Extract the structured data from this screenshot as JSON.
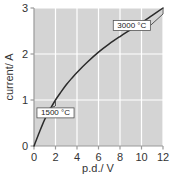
{
  "chart_data": {
    "type": "line",
    "title": "",
    "xlabel": "p.d./ V",
    "ylabel": "current/ A",
    "xlim": [
      0,
      12
    ],
    "ylim": [
      0,
      3
    ],
    "grid": true,
    "legend": "none",
    "xticks": [
      "0",
      "2",
      "4",
      "6",
      "8",
      "10",
      "12"
    ],
    "xtick_values": [
      0,
      2,
      4,
      6,
      8,
      10,
      12
    ],
    "yticks": [
      "0",
      "1",
      "2",
      "3"
    ],
    "ytick_values": [
      0,
      1,
      2,
      3
    ],
    "series": [
      {
        "name": "filament lamp I-V characteristic",
        "color": "#2b2b2b",
        "x": [
          0,
          0.5,
          1,
          1.5,
          2,
          2.5,
          3,
          3.5,
          4,
          5,
          6,
          7,
          8,
          9,
          10,
          11,
          12
        ],
        "values": [
          0,
          0.3,
          0.58,
          0.8,
          1.0,
          1.17,
          1.33,
          1.47,
          1.6,
          1.83,
          2.04,
          2.22,
          2.38,
          2.53,
          2.68,
          2.84,
          3.0
        ]
      }
    ],
    "annotations": [
      {
        "label": "1500 °C",
        "point_x": 2.0,
        "point_y": 1.0,
        "box_x": 2.0,
        "box_y": 0.72
      },
      {
        "label": "3000 °C",
        "point_x": 12.0,
        "point_y": 3.0,
        "box_x": 9.1,
        "box_y": 2.62
      }
    ],
    "plot_background": "#d4d4d4",
    "gridline_color": "#ffffff",
    "axis_color": "#9a9a9a"
  }
}
